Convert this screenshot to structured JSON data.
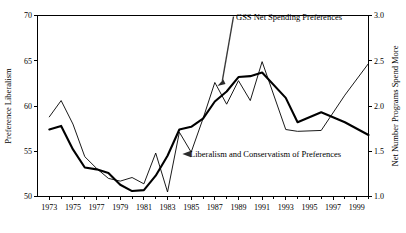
{
  "chart_data": {
    "type": "line",
    "title": "",
    "xlabel": "",
    "ylabel": "Preference Liberalism",
    "y2label": "Net Number Programs Spend More",
    "grid": false,
    "legend": "annotations",
    "xlim": [
      1972,
      2000
    ],
    "ylim": [
      50,
      70
    ],
    "y2lim": [
      1.0,
      3.0
    ],
    "x_ticks": [
      1973,
      1975,
      1977,
      1979,
      1981,
      1983,
      1985,
      1987,
      1989,
      1991,
      1993,
      1995,
      1997,
      1999
    ],
    "x_tick_labels": [
      "1973",
      "1975",
      "1977",
      "1979",
      "1981",
      "1983",
      "1985",
      "1987",
      "1989",
      "1991",
      "1993",
      "1995",
      "1997",
      "1999"
    ],
    "x_minor_ticks": [
      1974,
      1976,
      1978,
      1980,
      1982,
      1984,
      1986,
      1988,
      1990,
      1992,
      1994,
      1996,
      1998,
      2000
    ],
    "y_ticks": [
      50,
      55,
      60,
      65,
      70
    ],
    "y_tick_labels": [
      "50",
      "55",
      "60",
      "65",
      "70"
    ],
    "y2_ticks": [
      1.0,
      1.5,
      2.0,
      2.5,
      3.0
    ],
    "y2_tick_labels": [
      "1.0",
      "1.5",
      "2.0",
      "2.5",
      "3.0"
    ],
    "series": [
      {
        "name": "GSS Net Spending Preferences",
        "axis": "right",
        "style": "thin",
        "x": [
          1973,
          1974,
          1975,
          1976,
          1977,
          1978,
          1979,
          1980,
          1981,
          1982,
          1983,
          1984,
          1985,
          1986,
          1987,
          1988,
          1989,
          1990,
          1991,
          1993,
          1994,
          1996,
          1998,
          2000
        ],
        "values": [
          1.88,
          2.06,
          1.8,
          1.44,
          1.31,
          1.2,
          1.17,
          1.21,
          1.14,
          1.48,
          1.05,
          1.71,
          1.49,
          1.86,
          2.26,
          2.02,
          2.28,
          2.06,
          2.49,
          1.74,
          1.72,
          1.73,
          2.12,
          2.47
        ]
      },
      {
        "name": "Liberalism and Conservatism of Preferences",
        "axis": "left",
        "style": "thick",
        "x": [
          1973,
          1974,
          1975,
          1976,
          1977,
          1978,
          1979,
          1980,
          1981,
          1982,
          1983,
          1984,
          1985,
          1986,
          1987,
          1988,
          1989,
          1990,
          1991,
          1993,
          1994,
          1996,
          1998,
          2000
        ],
        "values": [
          57.4,
          57.8,
          55.2,
          53.2,
          53.0,
          52.6,
          51.3,
          50.6,
          50.7,
          52.3,
          54.5,
          57.4,
          57.7,
          58.6,
          60.5,
          61.6,
          63.2,
          63.3,
          63.7,
          60.9,
          58.2,
          59.3,
          58.2,
          56.8
        ]
      }
    ],
    "annotations": [
      {
        "text": "GSS Net Spending Preferences",
        "target_x": 1987,
        "target_y2": 2.26
      },
      {
        "text": "Liberalism and Conservatism of Preferences",
        "target_x": 1984,
        "target_y": 57.4
      }
    ]
  }
}
